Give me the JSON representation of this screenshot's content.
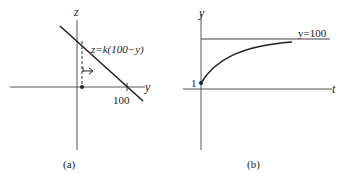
{
  "panel_a": {
    "caption": "(a)",
    "vertical_axis_label": "z",
    "horizontal_axis_label": "y",
    "line_label": "z=k(100−y)",
    "tick_label": "100"
  },
  "panel_b": {
    "caption": "(b)",
    "vertical_axis_label": "y",
    "horizontal_axis_label": "t",
    "asymptote_label": "y=100",
    "initial_value_label": "1"
  },
  "colors": {
    "ink": "#222222",
    "axis": "#555555"
  }
}
